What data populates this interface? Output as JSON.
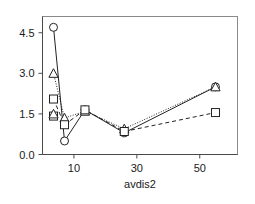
{
  "chart_data": {
    "type": "line",
    "title": "",
    "xlabel": "avdis2",
    "ylabel": "",
    "xlim": [
      0,
      62
    ],
    "ylim": [
      0,
      5.1
    ],
    "xticks": [
      10,
      30,
      50
    ],
    "xtick_labels": [
      "10",
      "30",
      "50"
    ],
    "yticks": [
      0.0,
      1.5,
      3.0,
      4.5
    ],
    "ytick_labels": [
      "0.0",
      "1.5",
      "3.0",
      "4.5"
    ],
    "grid": false,
    "legend": "none",
    "x": [
      3.5,
      7.0,
      13.5,
      26.0,
      55.0
    ],
    "series": [
      {
        "name": "circle-series",
        "marker": "circle",
        "linestyle": "solid",
        "values": [
          4.7,
          0.5,
          1.65,
          0.8,
          2.5
        ]
      },
      {
        "name": "triangle-series",
        "marker": "triangle",
        "linestyle": "dotted",
        "values": [
          3.0,
          1.35,
          1.6,
          0.95,
          2.5
        ]
      },
      {
        "name": "square-series",
        "marker": "square",
        "linestyle": "dashed",
        "values": [
          2.05,
          1.1,
          1.65,
          0.85,
          1.55
        ]
      }
    ],
    "extra_markers": [
      {
        "series": "square-series",
        "x": 3.5,
        "y": 1.42,
        "marker": "square"
      },
      {
        "series": "triangle-series",
        "x": 3.5,
        "y": 1.5,
        "marker": "triangle"
      }
    ],
    "colors": {
      "line": "#222222",
      "marker_fill": "#ffffff",
      "marker_stroke": "#222222",
      "frame": "#8a8a8a",
      "text": "#1a1a1a",
      "background": "#ffffff"
    }
  },
  "axes": {
    "x_axis_title": "avdis2",
    "x_tick_labels": [
      "10",
      "30",
      "50"
    ],
    "y_tick_labels": [
      "0.0",
      "1.5",
      "3.0",
      "4.5"
    ]
  }
}
